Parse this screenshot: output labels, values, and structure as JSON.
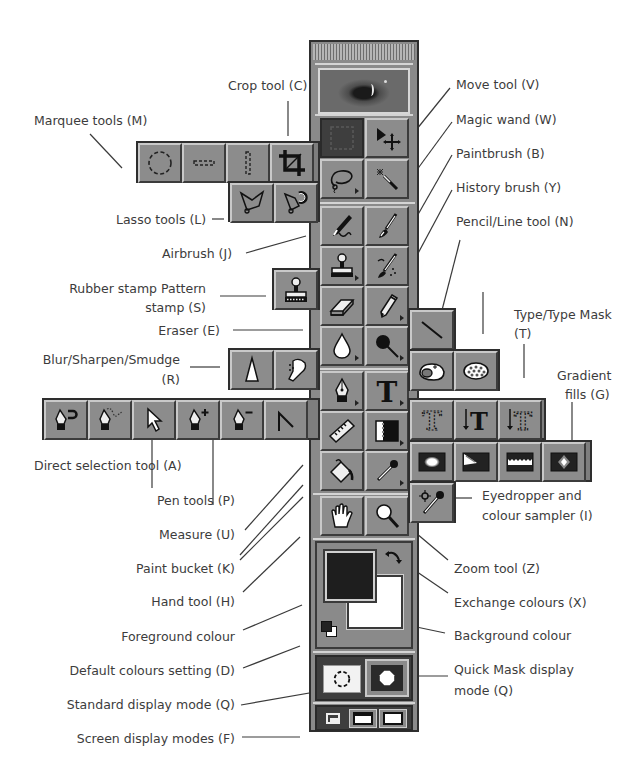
{
  "diagram": {
    "labels": {
      "crop": "Crop tool (C)",
      "marquee": "Marquee tools (M)",
      "lasso": "Lasso tools (L)",
      "airbrush": "Airbrush (J)",
      "rubber_stamp_1": "Rubber stamp Pattern",
      "rubber_stamp_2": "stamp (S)",
      "eraser": "Eraser (E)",
      "blur_1": "Blur/Sharpen/Smudge",
      "blur_2": "(R)",
      "direct_selection": "Direct selection tool (A)",
      "pen": "Pen tools (P)",
      "measure": "Measure (U)",
      "paint_bucket": "Paint bucket (K)",
      "hand": "Hand tool (H)",
      "foreground": "Foreground colour",
      "default_colours": "Default colours setting (D)",
      "standard_mode": "Standard display mode (Q)",
      "screen_modes": "Screen display modes (F)",
      "move": "Move tool (V)",
      "magic_wand": "Magic wand (W)",
      "paintbrush": "Paintbrush (B)",
      "history_brush": "History brush (Y)",
      "pencil_line": "Pencil/Line tool (N)",
      "type_1": "Type/Type Mask",
      "type_2": "(T)",
      "gradient_1": "Gradient",
      "gradient_2": "fills (G)",
      "eyedropper_1": "Eyedropper and",
      "eyedropper_2": "colour sampler (I)",
      "zoom": "Zoom tool (Z)",
      "exchange": "Exchange colours (X)",
      "background": "Background colour",
      "quickmask_1": "Quick Mask display",
      "quickmask_2": "mode (Q)"
    },
    "colors": {
      "toolbox_bg": "#8a8a8a",
      "button_face": "#8c8c8c",
      "dark_border": "#2e2e2e",
      "foreground_swatch": "#1e1e1e",
      "background_swatch": "#ffffff",
      "label_text": "#3c3c3c"
    }
  }
}
